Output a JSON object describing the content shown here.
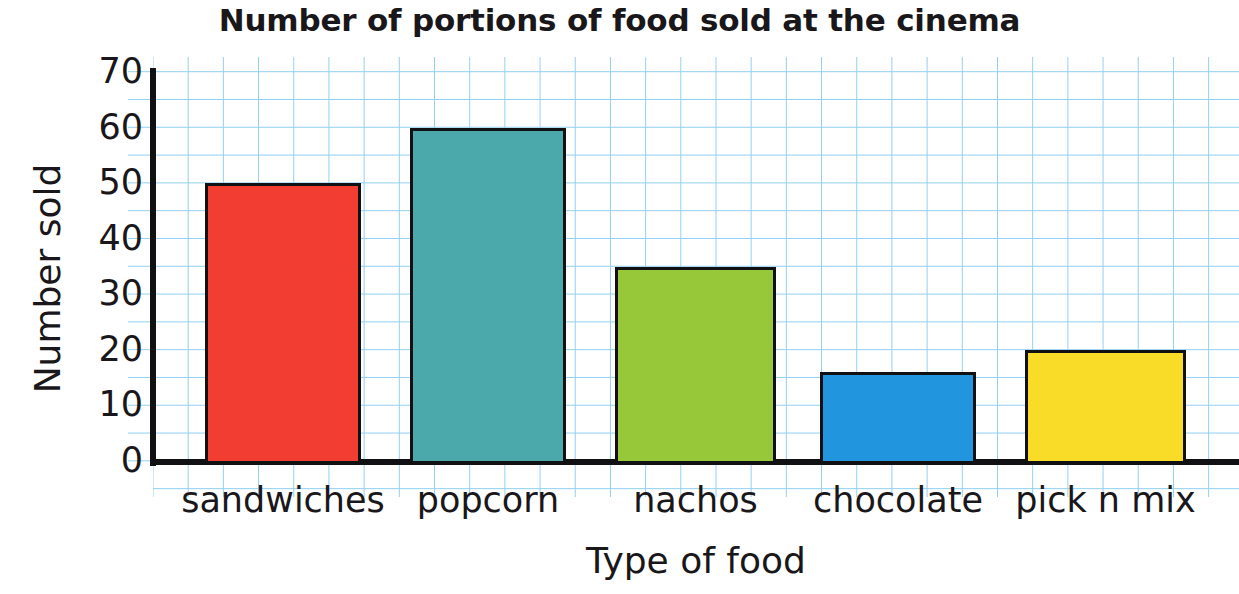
{
  "chart_data": {
    "type": "bar",
    "title": "Number of portions of food sold at the cinema",
    "xlabel": "Type of food",
    "ylabel": "Number sold",
    "categories": [
      "sandwiches",
      "popcorn",
      "nachos",
      "chocolate",
      "pick n mix"
    ],
    "values": [
      50,
      60,
      35,
      16,
      20
    ],
    "colors": [
      "#F23D33",
      "#4BA8AB",
      "#97C83A",
      "#2196DE",
      "#F8DC28"
    ],
    "bar_outline_color": "#111012",
    "ylim": [
      0,
      70
    ],
    "ytick_labels": [
      "0",
      "10",
      "20",
      "30",
      "40",
      "50",
      "60",
      "70"
    ],
    "ytick_values": [
      0,
      10,
      20,
      30,
      40,
      50,
      60,
      70
    ],
    "grid": true,
    "grid_color": "#7ec8ef",
    "legend": "none",
    "axis_color": "#111012",
    "background": "#ffffff"
  }
}
